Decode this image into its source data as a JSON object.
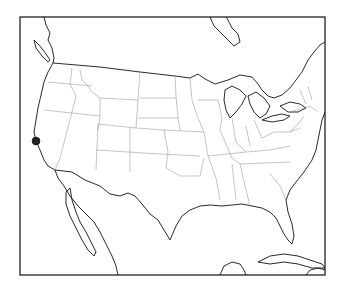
{
  "map": {
    "region": "Contiguous United States",
    "style": "outline",
    "frame_color": "#222222",
    "coast_color": "#111111",
    "state_line_color": "#888888",
    "markers": [
      {
        "name": "California point",
        "state": "California",
        "x": 36,
        "y": 141,
        "r": 4,
        "color": "#222222"
      }
    ]
  }
}
